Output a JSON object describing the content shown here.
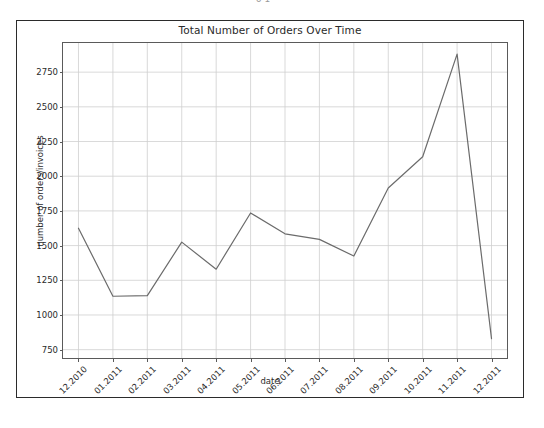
{
  "page": {
    "top_sliver_text": "6 1",
    "background_color": "#ffffff",
    "frame_color": "#2b2b2b"
  },
  "chart_data": {
    "type": "line",
    "title": "Total Number of Orders Over Time",
    "xlabel": "date",
    "ylabel": "number of orders/invoices",
    "categories": [
      "12.2010",
      "01.2011",
      "02.2011",
      "03.2011",
      "04.2011",
      "05.2011",
      "06.2011",
      "07.2011",
      "08.2011",
      "09.2011",
      "10.2011",
      "11.2011",
      "12.2011"
    ],
    "values": [
      1625,
      1135,
      1140,
      1525,
      1330,
      1735,
      1585,
      1545,
      1425,
      1915,
      2140,
      2880,
      830
    ],
    "series": [
      {
        "name": "number of orders/invoices",
        "values": [
          1625,
          1135,
          1140,
          1525,
          1330,
          1735,
          1585,
          1545,
          1425,
          1915,
          2140,
          2880,
          830
        ],
        "color": "#6b6b6b"
      }
    ],
    "yticks": [
      750,
      1000,
      1250,
      1500,
      1750,
      2000,
      2250,
      2500,
      2750
    ],
    "ytick_labels": [
      "750",
      "1000",
      "1250",
      "1500",
      "1750",
      "2000",
      "2250",
      "2500",
      "2750"
    ],
    "ylim": [
      690,
      2960
    ],
    "xlim": [
      -0.45,
      12.45
    ],
    "grid": true,
    "grid_color": "#cfcfcf",
    "legend": "none",
    "line_color": "#6b6b6b",
    "line_width": 1.2,
    "markers": "none"
  }
}
